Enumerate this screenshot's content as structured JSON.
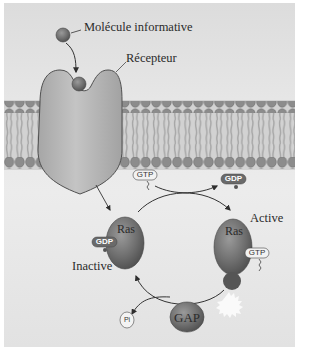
{
  "diagram": {
    "type": "signaling-pathway",
    "topic": "Ras GTPase cycle activated by membrane receptor",
    "labels": {
      "signal_molecule": "Molécule informative",
      "receptor": "Récepteur",
      "active": "Active",
      "inactive": "Inactive"
    },
    "proteins": {
      "ras_inactive": "Ras",
      "ras_active": "Ras",
      "gap": "GAP"
    },
    "nucleotides": {
      "gtp_incoming": "GTP",
      "gdp_released": "GDP",
      "gdp_bound": "GDP",
      "gtp_bound": "GTP",
      "phosphate": "Pi"
    },
    "colors": {
      "background": "#e6e6e6",
      "membrane_head": "#8f8f8f",
      "membrane_tail": "#a8a8a8",
      "receptor": "#b4b4b4",
      "protein": "#6e6e6e",
      "arrow": "#3a3a3a"
    },
    "edges": [
      {
        "from": "signal_molecule",
        "to": "receptor",
        "label": "binds"
      },
      {
        "from": "receptor",
        "to": "ras_inactive",
        "label": "activates"
      },
      {
        "from": "ras_inactive",
        "to": "ras_active",
        "label": "GDP → GTP exchange"
      },
      {
        "from": "ras_active",
        "to": "ras_inactive",
        "label": "GAP-mediated hydrolysis, releases Pi"
      }
    ]
  }
}
